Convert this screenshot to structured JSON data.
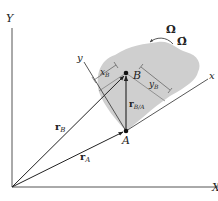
{
  "diagram": {
    "colors": {
      "background": "#ffffff",
      "body_fill": "#cfcfcf",
      "line": "#333333",
      "axes": "#555555"
    },
    "global_axes": {
      "y_label": "Y",
      "x_label": "X"
    },
    "local_axes": {
      "x_label": "x",
      "y_label": "y"
    },
    "points": {
      "A": "A",
      "B": "B"
    },
    "vectors": {
      "rA": {
        "symbol": "r",
        "subscript": "A"
      },
      "rB": {
        "symbol": "r",
        "subscript": "B"
      },
      "rBA": {
        "symbol": "r",
        "subscript": "B/A"
      }
    },
    "dimensions": {
      "xB": {
        "symbol": "x",
        "subscript": "B"
      },
      "yB": {
        "symbol": "y",
        "subscript": "B"
      }
    },
    "rotation": {
      "omega": "Ω",
      "omega_dot": "Ω̇"
    }
  }
}
